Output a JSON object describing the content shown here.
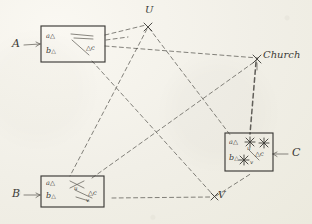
{
  "sketch": {
    "title": "Hand-drawn triangulation / resection sketch",
    "medium": "pencil on paper (scanned)",
    "ink_color": "#3b3a36",
    "paper_color": "#f2f0e9"
  },
  "callouts": {
    "a_label": "A",
    "b_label": "B",
    "c_label": "C"
  },
  "stations": {
    "u_label": "U",
    "v_label": "V",
    "church_label": "Church"
  },
  "boxes": [
    {
      "id": "box-a",
      "callout": "A",
      "vertices": {
        "a": "a",
        "b": "b",
        "c": "c"
      },
      "marks": []
    },
    {
      "id": "box-b",
      "callout": "B",
      "vertices": {
        "a": "a",
        "b": "b",
        "c": "c"
      },
      "marks": [
        {
          "name": "u",
          "text": "u"
        },
        {
          "name": "v",
          "text": "v"
        }
      ]
    },
    {
      "id": "box-c",
      "callout": "C",
      "vertices": {
        "a": "a",
        "b": "b",
        "c": "c"
      },
      "marks": [
        {
          "name": "u",
          "text": "u"
        },
        {
          "name": "v",
          "text": "v"
        }
      ]
    }
  ],
  "glyphs": {
    "triangle": "△",
    "arrow_right": "→",
    "arrow_left": "←",
    "star": "✳"
  }
}
